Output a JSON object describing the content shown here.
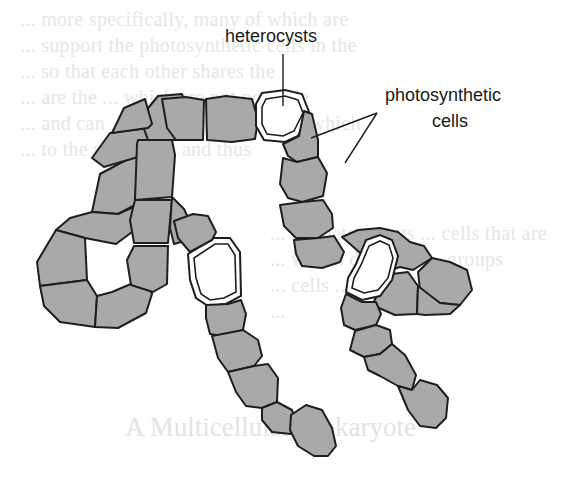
{
  "diagram": {
    "labels": {
      "heterocysts": "heterocysts",
      "photosynthetic_line1": "photosynthetic",
      "photosynthetic_line2": "cells"
    },
    "colors": {
      "photosynthetic_cell_fill": "#a9a9a9",
      "heterocyst_fill": "#ffffff",
      "outline": "#1e1e1e",
      "background": "#ffffff"
    }
  },
  "bleed_through": {
    "lines": [
      "... more specifically, many of which are",
      "... support the photosynthetic cells in the",
      "... so that each other shares the",
      "... are the ... which are not possible",
      "... and can ... from photosynthesis, which",
      "... to the support ... and thus"
    ],
    "lines_lower": [
      "... the heterocysts ... cells that are",
      "... within different ... groups",
      "... cells ... with ...",
      "..."
    ],
    "heading": "A Multicellular Prokaryote"
  }
}
